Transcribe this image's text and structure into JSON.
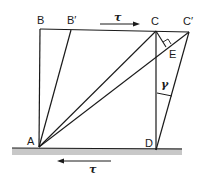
{
  "diagram": {
    "colors": {
      "line": "#1a1a1a",
      "ground": "#c8c8c8",
      "background": "#ffffff"
    },
    "points": {
      "A": {
        "label": "A",
        "x": 39,
        "y": 147
      },
      "B": {
        "label": "B",
        "x": 40,
        "y": 29
      },
      "B_prime": {
        "label": "B′",
        "x": 71,
        "y": 30
      },
      "C": {
        "label": "C",
        "x": 156,
        "y": 31
      },
      "C_prime": {
        "label": "C′",
        "x": 189,
        "y": 32
      },
      "D": {
        "label": "D",
        "x": 156,
        "y": 150
      },
      "E": {
        "label": "E",
        "x": 167,
        "y": 48
      }
    },
    "labels": {
      "A": "A",
      "B": "B",
      "B_prime": "B′",
      "C": "C",
      "C_prime": "C′",
      "D": "D",
      "E": "E",
      "tau_top": "τ",
      "tau_bottom": "τ",
      "gamma": "γ"
    },
    "edges": [
      [
        "A",
        "B"
      ],
      [
        "B",
        "C_prime"
      ],
      [
        "A",
        "B_prime"
      ],
      [
        "C",
        "D"
      ],
      [
        "D",
        "C_prime"
      ],
      [
        "A",
        "C"
      ],
      [
        "A",
        "C_prime"
      ],
      [
        "C",
        "E"
      ],
      [
        "A",
        "D"
      ]
    ],
    "annotations": {
      "top_force": {
        "symbol": "τ",
        "direction": "right"
      },
      "bottom_force": {
        "symbol": "τ",
        "direction": "left"
      },
      "shear_angle": {
        "symbol": "γ",
        "between": [
          "CD",
          "DC′"
        ]
      },
      "right_angle_at": "E"
    }
  }
}
